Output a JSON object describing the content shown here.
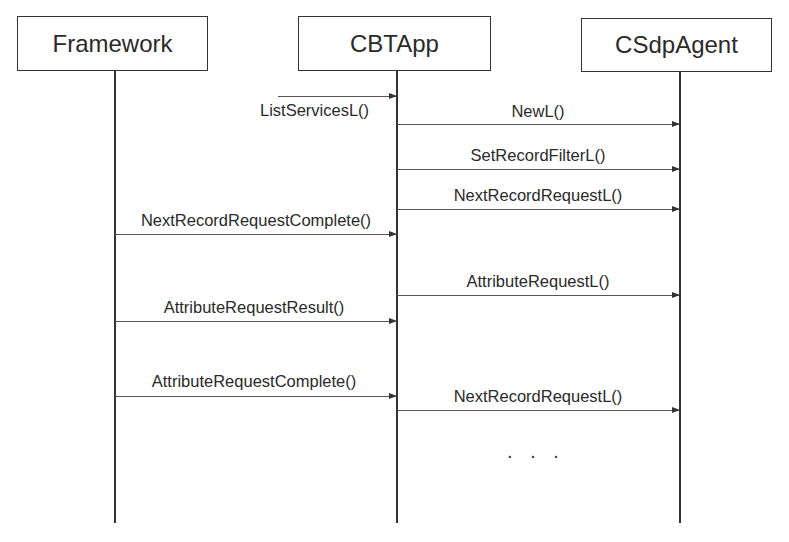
{
  "diagram": {
    "type": "sequence-diagram",
    "participants": [
      {
        "id": "framework",
        "label": "Framework"
      },
      {
        "id": "cbtapp",
        "label": "CBTApp"
      },
      {
        "id": "csdpagent",
        "label": "CSdpAgent"
      }
    ],
    "messages": [
      {
        "label": "ListServicesL()",
        "from": "external",
        "to": "cbtapp"
      },
      {
        "label": "NewL()",
        "from": "cbtapp",
        "to": "csdpagent"
      },
      {
        "label": "SetRecordFilterL()",
        "from": "cbtapp",
        "to": "csdpagent"
      },
      {
        "label": "NextRecordRequestL()",
        "from": "cbtapp",
        "to": "csdpagent"
      },
      {
        "label": "NextRecordRequestComplete()",
        "from": "framework",
        "to": "cbtapp"
      },
      {
        "label": "AttributeRequestL()",
        "from": "cbtapp",
        "to": "csdpagent"
      },
      {
        "label": "AttributeRequestResult()",
        "from": "framework",
        "to": "cbtapp"
      },
      {
        "label": "AttributeRequestComplete()",
        "from": "framework",
        "to": "cbtapp"
      },
      {
        "label": "NextRecordRequestL()",
        "from": "cbtapp",
        "to": "csdpagent"
      }
    ],
    "continuation": ". . ."
  }
}
